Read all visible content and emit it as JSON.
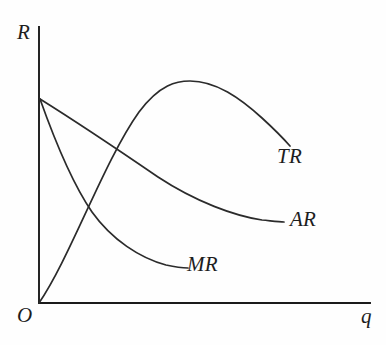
{
  "figure": {
    "background_color": "#fefefe",
    "line_color": "#2b2b2b",
    "axis_color": "#1a1a1a"
  },
  "axes": {
    "y_label": "R",
    "x_label": "q",
    "origin_label": "O",
    "y_axis_name": "Revenue",
    "x_axis_name": "Quantity",
    "origin_px": [
      39,
      303
    ],
    "y_axis_top_px": [
      39,
      27
    ],
    "x_axis_right_px": [
      370,
      303
    ]
  },
  "curves": [
    {
      "id": "TR",
      "label": "TR",
      "name": "total-revenue",
      "shape": "inverted-parabola",
      "start_px": [
        39,
        303
      ],
      "peak_px": [
        188,
        81
      ],
      "end_px": [
        290,
        146
      ],
      "path": "M 39 303 C 70 258 104 161 139 112 C 160 84 177 81 190 81 C 216 81 240 98 262 118 C 274 129 283 138 290 146"
    },
    {
      "id": "AR",
      "label": "AR",
      "name": "average-revenue",
      "shape": "convex-decreasing",
      "start_px": [
        40,
        99
      ],
      "end_px": [
        284,
        222
      ],
      "path": "M 40 99 C 80 124 120 151 158 177 C 196 202 235 216 262 220 C 272 221 279 222 284 222"
    },
    {
      "id": "MR",
      "label": "MR",
      "name": "marginal-revenue",
      "shape": "convex-decreasing-steep",
      "start_px": [
        40,
        99
      ],
      "end_px": [
        188,
        268
      ],
      "path": "M 40 99 C 56 144 72 183 92 212 C 112 240 140 258 166 265 C 175 267 183 268 188 268"
    }
  ],
  "intersections": {
    "tr_crosses_mr_px": [
      83,
      201
    ],
    "tr_crosses_ar_px": [
      105,
      163
    ],
    "ar_mr_common_origin_px": [
      40,
      99
    ]
  },
  "chart_data": {
    "type": "line",
    "title": "",
    "xlabel": "q",
    "ylabel": "R",
    "grid": false,
    "legend": "inline-curve-labels",
    "xlim": [
      0,
      10
    ],
    "ylim": [
      0,
      10
    ],
    "series": [
      {
        "name": "TR",
        "description": "Total revenue: rises from origin, peaks, then declines",
        "x": [
          0,
          1,
          2,
          3,
          4,
          5,
          6,
          7,
          8
        ],
        "y": [
          0,
          2.6,
          4.8,
          6.5,
          7.6,
          8.0,
          7.7,
          6.8,
          5.7
        ]
      },
      {
        "name": "AR",
        "description": "Average revenue: downward sloping, convex to origin",
        "x": [
          0,
          1,
          2,
          3,
          4,
          5,
          6,
          7
        ],
        "y": [
          7.4,
          6.5,
          5.7,
          4.9,
          4.2,
          3.6,
          3.1,
          2.9
        ]
      },
      {
        "name": "MR",
        "description": "Marginal revenue: falls faster than AR, convex to origin",
        "x": [
          0,
          1,
          2,
          3,
          4,
          5
        ],
        "y": [
          7.4,
          5.8,
          4.4,
          3.1,
          2.0,
          1.3
        ]
      }
    ]
  }
}
